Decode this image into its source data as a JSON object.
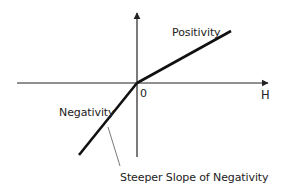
{
  "figure": {
    "type": "piecewise linear valence response diagram",
    "axes": {
      "x_label": "H",
      "origin_label": "0",
      "x_range": [
        -120,
        131
      ],
      "y_range": [
        -74,
        70
      ]
    },
    "labels": {
      "positivity": "Positivity",
      "negativity": "Negativity",
      "annotation": "Steeper Slope of Negativity"
    },
    "colors": {
      "line": "#111111",
      "axis": "#222222",
      "leader": "#555555",
      "text": "#222222",
      "background": "#ffffff"
    },
    "segments": [
      {
        "name": "Positivity",
        "from": [
          0,
          0
        ],
        "to": [
          94,
          52
        ],
        "slope": "shallow"
      },
      {
        "name": "Negativity",
        "from": [
          -58,
          -72
        ],
        "to": [
          0,
          0
        ],
        "slope": "steep"
      }
    ]
  }
}
